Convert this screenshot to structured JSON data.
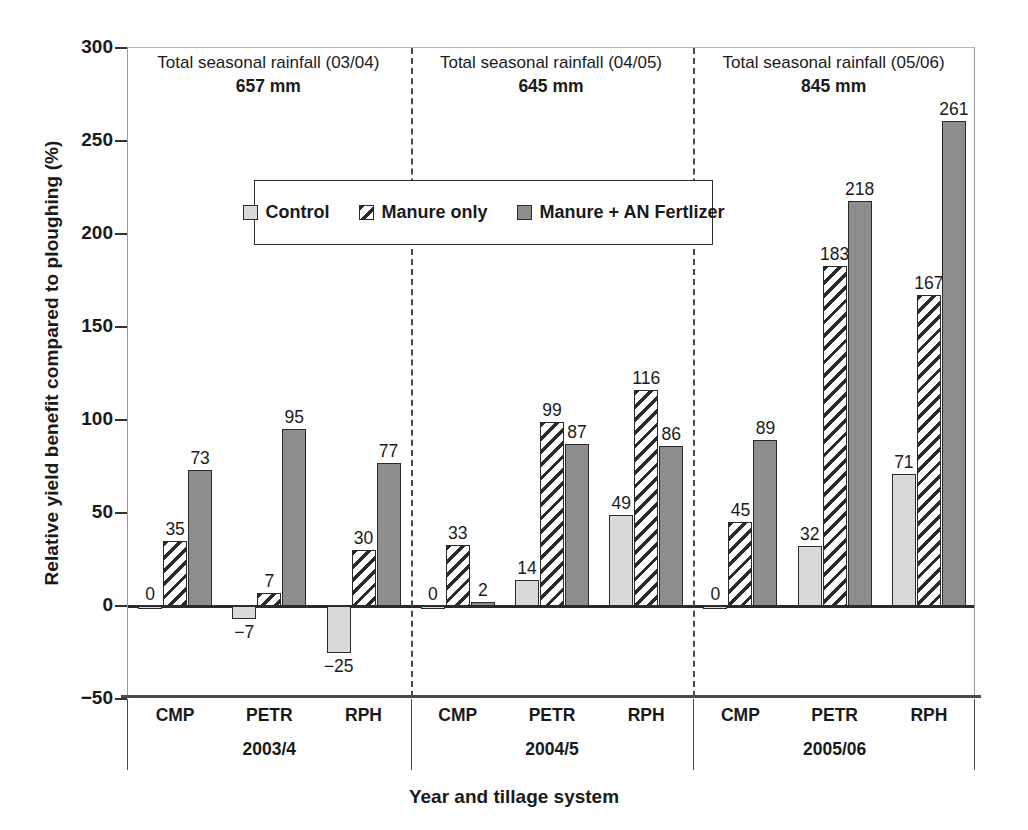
{
  "chart_data": {
    "type": "bar",
    "title": "",
    "xlabel": "Year and tillage system",
    "ylabel": "Relative yield benefit compared to ploughing (%)",
    "ylim": [
      -50,
      300
    ],
    "ytick_step": 50,
    "yticks": [
      "300",
      "250",
      "200",
      "150",
      "100",
      "50",
      "0",
      "−50"
    ],
    "ytick_values": [
      300,
      250,
      200,
      150,
      100,
      50,
      0,
      -50
    ],
    "grid": false,
    "legend_position": "inside-top-center",
    "categories": [
      "CMP",
      "PETR",
      "RPH",
      "CMP",
      "PETR",
      "RPH",
      "CMP",
      "PETR",
      "RPH"
    ],
    "series": [
      {
        "name": "Control",
        "values": [
          0,
          -7,
          -25,
          0,
          14,
          49,
          0,
          32,
          71
        ]
      },
      {
        "name": "Manure only",
        "values": [
          35,
          7,
          30,
          33,
          99,
          116,
          45,
          183,
          167
        ]
      },
      {
        "name": "Manure + AN Fertlizer",
        "values": [
          73,
          95,
          77,
          2,
          87,
          86,
          89,
          218,
          261
        ]
      }
    ],
    "groups": [
      {
        "year": "2003/4",
        "annotation_line1": "Total seasonal rainfall (03/04)",
        "annotation_line2": "657 mm",
        "rainfall_mm": 657,
        "tillage": [
          {
            "label": "CMP",
            "bars": [
              {
                "series": "Control",
                "value": 0,
                "data_label": "0"
              },
              {
                "series": "Manure only",
                "value": 35,
                "data_label": "35"
              },
              {
                "series": "Manure + AN Fertlizer",
                "value": 73,
                "data_label": "73"
              }
            ]
          },
          {
            "label": "PETR",
            "bars": [
              {
                "series": "Control",
                "value": -7,
                "data_label": "−7"
              },
              {
                "series": "Manure only",
                "value": 7,
                "data_label": "7"
              },
              {
                "series": "Manure + AN Fertlizer",
                "value": 95,
                "data_label": "95"
              }
            ]
          },
          {
            "label": "RPH",
            "bars": [
              {
                "series": "Control",
                "value": -25,
                "data_label": "−25"
              },
              {
                "series": "Manure only",
                "value": 30,
                "data_label": "30"
              },
              {
                "series": "Manure + AN Fertlizer",
                "value": 77,
                "data_label": "77"
              }
            ]
          }
        ]
      },
      {
        "year": "2004/5",
        "annotation_line1": "Total seasonal rainfall (04/05)",
        "annotation_line2": "645 mm",
        "rainfall_mm": 645,
        "tillage": [
          {
            "label": "CMP",
            "bars": [
              {
                "series": "Control",
                "value": 0,
                "data_label": "0"
              },
              {
                "series": "Manure only",
                "value": 33,
                "data_label": "33"
              },
              {
                "series": "Manure + AN Fertlizer",
                "value": 2,
                "data_label": "2"
              }
            ]
          },
          {
            "label": "PETR",
            "bars": [
              {
                "series": "Control",
                "value": 14,
                "data_label": "14"
              },
              {
                "series": "Manure only",
                "value": 99,
                "data_label": "99"
              },
              {
                "series": "Manure + AN Fertlizer",
                "value": 87,
                "data_label": "87"
              }
            ]
          },
          {
            "label": "RPH",
            "bars": [
              {
                "series": "Control",
                "value": 49,
                "data_label": "49"
              },
              {
                "series": "Manure only",
                "value": 116,
                "data_label": "116"
              },
              {
                "series": "Manure + AN Fertlizer",
                "value": 86,
                "data_label": "86"
              }
            ]
          }
        ]
      },
      {
        "year": "2005/06",
        "annotation_line1": "Total seasonal rainfall (05/06)",
        "annotation_line2": "845 mm",
        "rainfall_mm": 845,
        "tillage": [
          {
            "label": "CMP",
            "bars": [
              {
                "series": "Control",
                "value": 0,
                "data_label": "0"
              },
              {
                "series": "Manure only",
                "value": 45,
                "data_label": "45"
              },
              {
                "series": "Manure + AN Fertlizer",
                "value": 89,
                "data_label": "89"
              }
            ]
          },
          {
            "label": "PETR",
            "bars": [
              {
                "series": "Control",
                "value": 32,
                "data_label": "32"
              },
              {
                "series": "Manure only",
                "value": 183,
                "data_label": "183"
              },
              {
                "series": "Manure + AN Fertlizer",
                "value": 218,
                "data_label": "218"
              }
            ]
          },
          {
            "label": "RPH",
            "bars": [
              {
                "series": "Control",
                "value": 71,
                "data_label": "71"
              },
              {
                "series": "Manure only",
                "value": 167,
                "data_label": "167"
              },
              {
                "series": "Manure + AN Fertlizer",
                "value": 261,
                "data_label": "261"
              }
            ]
          }
        ]
      }
    ]
  },
  "legend": {
    "items": [
      {
        "label": "Control",
        "style": "solid-light",
        "color": "#d9d9d9"
      },
      {
        "label": "Manure only",
        "style": "hatched",
        "color": "#ffffff"
      },
      {
        "label": "Manure + AN Fertlizer",
        "style": "solid-dark",
        "color": "#8d8d8d"
      }
    ]
  },
  "axis": {
    "y_title": "Relative yield benefit compared to ploughing (%)",
    "x_title": "Year and tillage system"
  },
  "colors": {
    "control": "#d9d9d9",
    "manure": "#ffffff",
    "fertilizer": "#8d8d8d",
    "outline": "#2a2a2a",
    "axis": "#4a4a4a"
  }
}
